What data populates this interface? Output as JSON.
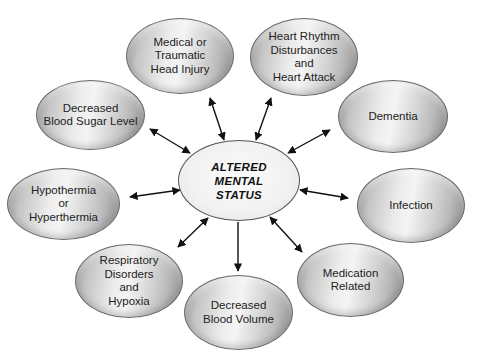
{
  "diagram": {
    "center": {
      "label": "ALTERED\nMENTAL\nSTATUS"
    },
    "nodes": [
      {
        "id": "head-injury",
        "label": "Medical or\nTraumatic\nHead Injury"
      },
      {
        "id": "heart",
        "label": "Heart Rhythm\nDisturbances\nand\nHeart Attack"
      },
      {
        "id": "blood-sugar",
        "label": "Decreased\nBlood Sugar Level"
      },
      {
        "id": "dementia",
        "label": "Dementia"
      },
      {
        "id": "temperature",
        "label": "Hypothermia\nor\nHyperthermia"
      },
      {
        "id": "infection",
        "label": "Infection"
      },
      {
        "id": "respiratory",
        "label": "Respiratory\nDisorders\nand\nHypoxia"
      },
      {
        "id": "blood-volume",
        "label": "Decreased\nBlood Volume"
      },
      {
        "id": "medication",
        "label": "Medication\nRelated"
      }
    ],
    "edge_color": "#111111",
    "edge_type": "bidirectional-arrow"
  }
}
